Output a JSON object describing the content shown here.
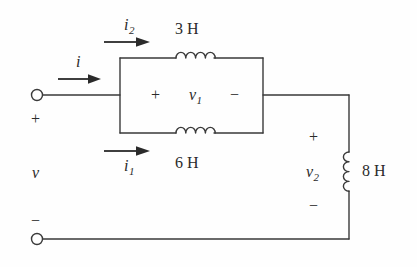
{
  "figure": {
    "kind": "electrical-circuit-schematic",
    "line_color": "#3a3a3a",
    "text_color": "#2a2a2a",
    "background": "#fefefe"
  },
  "components": {
    "inductor_top": {
      "value_label": "3 H",
      "henries": 3,
      "orientation": "horizontal",
      "coil_loops": 4
    },
    "inductor_bottom": {
      "value_label": "6 H",
      "henries": 6,
      "orientation": "horizontal",
      "coil_loops": 4
    },
    "inductor_right": {
      "value_label": "8 H",
      "henries": 8,
      "orientation": "vertical",
      "coil_loops": 4
    }
  },
  "currents": {
    "source": {
      "symbol": "i",
      "subscript": ""
    },
    "top_branch": {
      "symbol": "i",
      "subscript": "2"
    },
    "bottom_branch": {
      "symbol": "i",
      "subscript": "1"
    }
  },
  "voltages": {
    "source": {
      "symbol": "v",
      "subscript": "",
      "plus": "+",
      "minus": "−"
    },
    "parallel_block": {
      "symbol": "v",
      "subscript": "1",
      "plus": "+",
      "minus": "−"
    },
    "right_inductor": {
      "symbol": "v",
      "subscript": "2",
      "plus": "+",
      "minus": "−"
    }
  },
  "terminals": {
    "top": {
      "name": "positive-terminal"
    },
    "bottom": {
      "name": "negative-terminal"
    }
  }
}
